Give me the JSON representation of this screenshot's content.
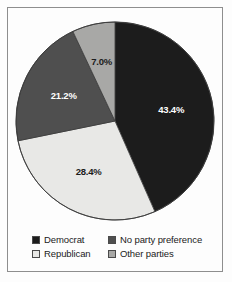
{
  "chart_data": {
    "type": "pie",
    "title": "",
    "subtitle": "",
    "xlabel": "",
    "ylabel": "",
    "legend_position": "bottom",
    "grid": false,
    "start_angle_deg": 0,
    "direction": "clockwise",
    "categories": [
      "Democrat",
      "Republican",
      "No party preference",
      "Other parties"
    ],
    "values": [
      43.4,
      28.4,
      21.2,
      7.0
    ],
    "slices": [
      {
        "label": "Democrat",
        "value": 43.4,
        "data_label": "43.4%",
        "color": "#1c1c1c",
        "label_color": "#ffffff"
      },
      {
        "label": "Republican",
        "value": 28.4,
        "data_label": "28.4%",
        "color": "#e8e8e6",
        "label_color": "#1b1b1b"
      },
      {
        "label": "No party preference",
        "value": 21.2,
        "data_label": "21.2%",
        "color": "#4f4f4f",
        "label_color": "#ffffff"
      },
      {
        "label": "Other parties",
        "value": 7.0,
        "data_label": "7.0%",
        "color": "#a8a8a6",
        "label_color": "#1b1b1b"
      }
    ]
  },
  "legend": {
    "entries": [
      {
        "label": "Democrat",
        "color": "#1c1c1c"
      },
      {
        "label": "No party preference",
        "color": "#4f4f4f"
      },
      {
        "label": "Republican",
        "color": "#e8e8e6"
      },
      {
        "label": "Other parties",
        "color": "#a8a8a6"
      }
    ]
  },
  "frame": {
    "border_color": "#8e8e8e",
    "background": "#fdfdfd"
  }
}
